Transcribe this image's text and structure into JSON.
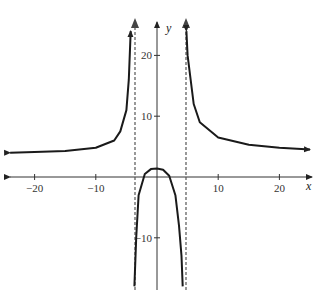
{
  "chart_data": {
    "type": "line",
    "title": "",
    "xlabel": "x",
    "ylabel": "y",
    "xlim": [
      -23,
      25
    ],
    "ylim": [
      -18,
      26
    ],
    "x_ticks": [
      -20,
      -10,
      10,
      20
    ],
    "y_ticks": [
      20,
      10,
      -10
    ],
    "x_tick_labels": [
      "−20",
      "−10",
      "10",
      "20"
    ],
    "y_tick_labels": [
      "20",
      "10",
      "−10"
    ],
    "vertical_asymptotes": [
      -4,
      4.5
    ],
    "horizontal_asymptote_approx": 4,
    "series": [
      {
        "name": "left branch",
        "x": [
          -24,
          -20,
          -15,
          -10,
          -7,
          -6,
          -5,
          -4.6,
          -4.3
        ],
        "y": [
          4.0,
          4.1,
          4.3,
          4.8,
          6.0,
          7.5,
          11.0,
          16.0,
          24.0
        ]
      },
      {
        "name": "middle branch",
        "x": [
          -3.7,
          -3.4,
          -3,
          -2,
          -1,
          0,
          1,
          2,
          3,
          3.6,
          4.0,
          4.2
        ],
        "y": [
          -18,
          -10,
          -3,
          0.5,
          1.3,
          1.4,
          1.2,
          0.2,
          -3,
          -8,
          -13,
          -18
        ]
      },
      {
        "name": "right branch",
        "x": [
          4.8,
          5,
          6,
          7,
          10,
          15,
          20,
          25
        ],
        "y": [
          24,
          20,
          12,
          9,
          6.5,
          5.3,
          4.8,
          4.5
        ]
      }
    ]
  },
  "axes": {
    "x_label": "x",
    "y_label": "y"
  }
}
